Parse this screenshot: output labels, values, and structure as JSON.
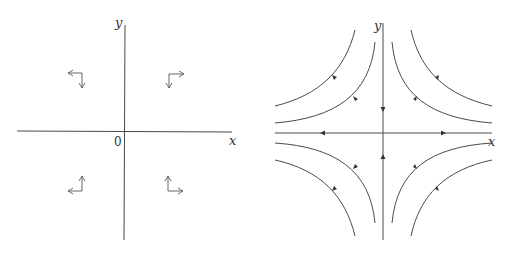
{
  "figure": {
    "panels": [
      {
        "id": "vector-field",
        "axes": {
          "x_label": "x",
          "y_label": "y",
          "origin_label": "0"
        },
        "vectors": [
          {
            "quadrant": "top-left",
            "horizontal": "left",
            "vertical": "down"
          },
          {
            "quadrant": "top-right",
            "horizontal": "right",
            "vertical": "down"
          },
          {
            "quadrant": "bottom-left",
            "horizontal": "left",
            "vertical": "up"
          },
          {
            "quadrant": "bottom-right",
            "horizontal": "right",
            "vertical": "up"
          }
        ]
      },
      {
        "id": "phase-portrait",
        "type": "saddle",
        "axes": {
          "x_label": "x",
          "y_label": "y"
        },
        "axis_flow": {
          "x_axis": "outward",
          "y_axis": "inward"
        },
        "trajectories_per_quadrant": 2
      }
    ]
  },
  "colors": {
    "line": "#4a4a4a",
    "text": "#333333",
    "background": "#ffffff"
  }
}
